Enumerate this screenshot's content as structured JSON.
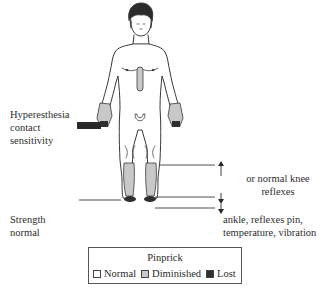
{
  "labels": {
    "left_top": [
      "Hyperesthesia",
      "contact",
      "sensitivity"
    ],
    "left_bottom": [
      "Strength",
      "normal"
    ],
    "right_top": [
      "or normal knee",
      "reflexes"
    ],
    "right_bottom": [
      "ankle, reflexes pin,",
      "temperature, vibration"
    ]
  },
  "legend": {
    "title": "Pinprick",
    "items": [
      {
        "label": "Normal",
        "color": "#ffffff"
      },
      {
        "label": "Diminished",
        "color": "#c8c8c8"
      },
      {
        "label": "Lost",
        "color": "#2f2f2f"
      }
    ]
  },
  "colors": {
    "outline": "#3a3a3a",
    "diminished": "#c8c8c8",
    "lost": "#2f2f2f"
  }
}
